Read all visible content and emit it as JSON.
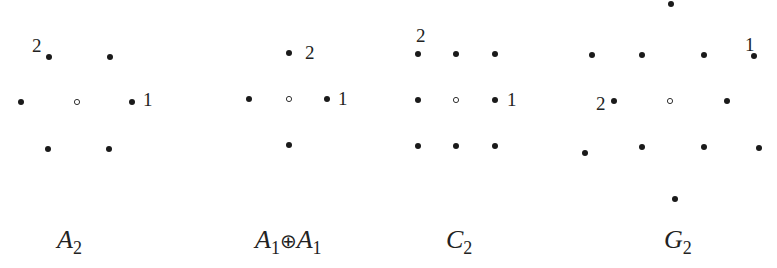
{
  "colors": {
    "dot": "#1a1a1a",
    "origin_stroke": "#333333",
    "background": "#ffffff"
  },
  "diagrams": [
    {
      "name": "A2",
      "caption": {
        "base": "A",
        "sub": "2",
        "x": 57,
        "y": 248
      },
      "origin": [
        77,
        102
      ],
      "points": [
        [
          49,
          57
        ],
        [
          110,
          57
        ],
        [
          21,
          102
        ],
        [
          132,
          102
        ],
        [
          48,
          149
        ],
        [
          109,
          149
        ]
      ],
      "labels": [
        {
          "text": "2",
          "x": 32,
          "y": 52
        },
        {
          "text": "1",
          "x": 143,
          "y": 106
        }
      ]
    },
    {
      "name": "A1+A1",
      "caption": {
        "base": "A",
        "sub": "1",
        "op": "⊕",
        "base2": "A",
        "sub2": "1",
        "x": 255,
        "y": 248
      },
      "origin": [
        289,
        99
      ],
      "points": [
        [
          289,
          53
        ],
        [
          249,
          99
        ],
        [
          327,
          99
        ],
        [
          289,
          145
        ]
      ],
      "labels": [
        {
          "text": "2",
          "x": 305,
          "y": 59
        },
        {
          "text": "1",
          "x": 338,
          "y": 105
        }
      ]
    },
    {
      "name": "C2",
      "caption": {
        "base": "C",
        "sub": "2",
        "x": 446,
        "y": 248
      },
      "origin": [
        456,
        100
      ],
      "points": [
        [
          418,
          54
        ],
        [
          456,
          54
        ],
        [
          495,
          54
        ],
        [
          418,
          100
        ],
        [
          495,
          100
        ],
        [
          418,
          146
        ],
        [
          456,
          146
        ],
        [
          495,
          146
        ]
      ],
      "labels": [
        {
          "text": "2",
          "x": 416,
          "y": 42
        },
        {
          "text": "1",
          "x": 507,
          "y": 106
        }
      ]
    },
    {
      "name": "G2",
      "caption": {
        "base": "G",
        "sub": "2",
        "x": 664,
        "y": 248
      },
      "origin": [
        670,
        101
      ],
      "points": [
        [
          671,
          4
        ],
        [
          592,
          55
        ],
        [
          642,
          55
        ],
        [
          704,
          55
        ],
        [
          754,
          56
        ],
        [
          614,
          101
        ],
        [
          727,
          101
        ],
        [
          585,
          153
        ],
        [
          642,
          147
        ],
        [
          704,
          147
        ],
        [
          759,
          148
        ],
        [
          675,
          199
        ]
      ],
      "labels": [
        {
          "text": "2",
          "x": 596,
          "y": 110
        },
        {
          "text": "1",
          "x": 745,
          "y": 51
        }
      ]
    }
  ]
}
